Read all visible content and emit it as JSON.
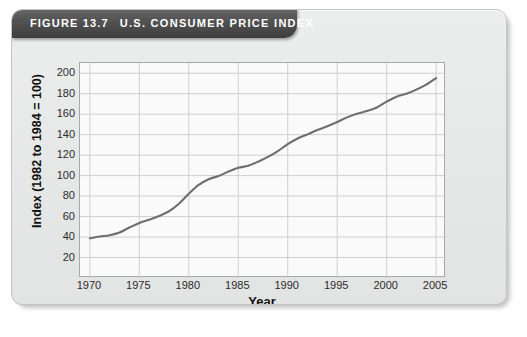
{
  "figure": {
    "number_label": "FIGURE 13.7",
    "title": "U.S. CONSUMER PRICE INDEX",
    "source": "Source: U.S. Bureau of Labor Statistics"
  },
  "colors": {
    "title_bar": "#4a4a4a",
    "line": "#6e6e6e",
    "card_background": "#e8e8e8",
    "plot_background": "#fafafa",
    "grid": "#cfcfcf",
    "axis": "#a8a8a8"
  },
  "chart_data": {
    "type": "line",
    "title": "U.S. CONSUMER PRICE INDEX",
    "xlabel": "Year",
    "ylabel": "Index (1982 to 1984 = 100)",
    "xlim": [
      1969,
      2006
    ],
    "ylim": [
      0,
      210
    ],
    "xticks": [
      1970,
      1975,
      1980,
      1985,
      1990,
      1995,
      2000,
      2005
    ],
    "yticks": [
      20,
      40,
      60,
      80,
      100,
      120,
      140,
      160,
      180,
      200
    ],
    "xtick_labels": [
      "1970",
      "1975",
      "1980",
      "1985",
      "1990",
      "1995",
      "2000",
      "2005"
    ],
    "ytick_labels": [
      "20",
      "40",
      "60",
      "80",
      "100",
      "120",
      "140",
      "160",
      "180",
      "200"
    ],
    "grid": true,
    "legend": false,
    "series": [
      {
        "name": "Consumer Price Index (CPI-U)",
        "x": [
          1970,
          1971,
          1972,
          1973,
          1974,
          1975,
          1976,
          1977,
          1978,
          1979,
          1980,
          1981,
          1982,
          1983,
          1984,
          1985,
          1986,
          1987,
          1988,
          1989,
          1990,
          1991,
          1992,
          1993,
          1994,
          1995,
          1996,
          1997,
          1998,
          1999,
          2000,
          2001,
          2002,
          2003,
          2004,
          2005
        ],
        "values": [
          38.8,
          40.5,
          41.8,
          44.4,
          49.3,
          53.8,
          56.9,
          60.6,
          65.2,
          72.6,
          82.4,
          90.9,
          96.5,
          99.6,
          103.9,
          107.6,
          109.6,
          113.6,
          118.3,
          124.0,
          130.7,
          136.2,
          140.3,
          144.5,
          148.2,
          152.4,
          156.9,
          160.5,
          163.0,
          166.6,
          172.2,
          177.1,
          179.9,
          184.0,
          188.9,
          195.3
        ]
      }
    ]
  }
}
